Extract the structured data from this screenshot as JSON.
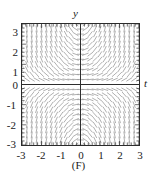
{
  "figure": {
    "caption": "(F)",
    "background_color": "#ffffff"
  },
  "axes": {
    "x_name": "t",
    "y_name": "y",
    "axis_color": "#2b2b2b",
    "frame_color": "#2b2b2b",
    "x_tick_labels": [
      "-3",
      "-2",
      "-1",
      "0",
      "1",
      "2",
      "3"
    ],
    "y_tick_labels": [
      "3",
      "2",
      "1",
      "0",
      "-1",
      "-2",
      "-3"
    ]
  },
  "chart_data": {
    "type": "scatter",
    "subtype": "slope-field",
    "title": "(F)",
    "xlabel": "t",
    "ylabel": "y",
    "xlim": [
      -3,
      3
    ],
    "ylim": [
      -3,
      3
    ],
    "xticks": [
      -3,
      -2,
      -1,
      0,
      1,
      2,
      3
    ],
    "yticks": [
      -3,
      -2,
      -1,
      0,
      1,
      2,
      3
    ],
    "minor_ticks_per_interval": 4,
    "grid": false,
    "legend": null,
    "mark_color": "#9a9a9a",
    "mark_length_px": 7,
    "slope_formula": "t*y",
    "grid_points": {
      "t_values": [
        -3,
        -2.75,
        -2.5,
        -2.25,
        -2,
        -1.75,
        -1.5,
        -1.25,
        -1,
        -0.75,
        -0.5,
        -0.25,
        0,
        0.25,
        0.5,
        0.75,
        1,
        1.25,
        1.5,
        1.75,
        2,
        2.25,
        2.5,
        2.75,
        3
      ],
      "y_values": [
        3,
        2.75,
        2.5,
        2.25,
        2,
        1.75,
        1.5,
        1.25,
        1,
        0.75,
        0.5,
        0.25,
        0,
        -0.25,
        -0.5,
        -0.75,
        -1,
        -1.25,
        -1.5,
        -1.75,
        -2,
        -2.25,
        -2.5,
        -2.75,
        -3
      ]
    },
    "sample_slopes": [
      {
        "t": -3,
        "y": 3,
        "slope": -9
      },
      {
        "t": -2,
        "y": 2,
        "slope": -4
      },
      {
        "t": -1,
        "y": 1,
        "slope": -1
      },
      {
        "t": 0,
        "y": 1,
        "slope": 0
      },
      {
        "t": 1,
        "y": 1,
        "slope": 1
      },
      {
        "t": 2,
        "y": 2,
        "slope": 4
      },
      {
        "t": 3,
        "y": 3,
        "slope": 9
      },
      {
        "t": -3,
        "y": -3,
        "slope": 9
      },
      {
        "t": -1,
        "y": -1,
        "slope": 1
      },
      {
        "t": 0,
        "y": -2,
        "slope": 0
      },
      {
        "t": 1,
        "y": -1,
        "slope": -1
      },
      {
        "t": 3,
        "y": -3,
        "slope": -9
      },
      {
        "t": 2,
        "y": 0,
        "slope": 0
      },
      {
        "t": -2,
        "y": 0,
        "slope": 0
      }
    ]
  }
}
